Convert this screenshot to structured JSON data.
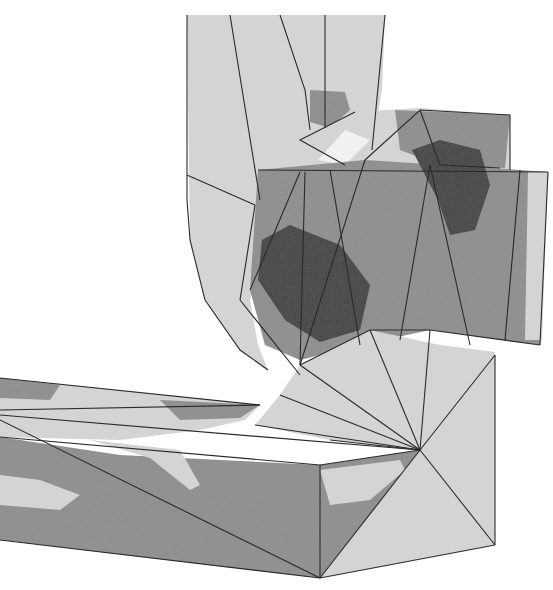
{
  "figure": {
    "width": 553,
    "height": 590,
    "background": "#ffffff",
    "colors": {
      "light": "#d6d6d6",
      "medium": "#8e8e8e",
      "dark": "#404040",
      "white_gap": "#f4f4f4",
      "edge": "#2a2a2a"
    }
  },
  "regions": [
    {
      "name": "vertical-pipe-body",
      "fill": "light",
      "points": "187,15 385,15 382,90 372,150 350,190 300,230 262,255 250,300 258,345 268,370 240,350 205,300 190,240"
    },
    {
      "name": "vertical-pipe-dark-patch",
      "fill": "medium",
      "points": "310,90 345,92 350,110 330,128 310,122"
    },
    {
      "name": "elbow-cap-light",
      "fill": "light",
      "points": "260,185 300,140 355,112 420,108 510,115 510,170 430,165 380,170 300,172 265,200"
    },
    {
      "name": "elbow-cap-medium",
      "fill": "medium",
      "points": "395,110 510,115 505,168 440,165 400,150"
    },
    {
      "name": "white-gap",
      "fill": "white_gap",
      "points": "318,160 345,130 370,140 345,165"
    },
    {
      "name": "front-cone-face",
      "fill": "medium",
      "points": "258,170 365,160 520,170 548,172 540,345 430,330 360,345 300,360 265,345 250,290"
    },
    {
      "name": "front-dark-blob",
      "fill": "dark",
      "points": "262,240 290,225 340,245 370,285 360,330 320,342 285,320 258,280"
    },
    {
      "name": "upper-dark-blob",
      "fill": "dark",
      "points": "412,150 440,140 480,150 490,185 475,230 450,235 438,200"
    },
    {
      "name": "right-light-strip",
      "fill": "light",
      "points": "528,172 548,172 542,340 525,340"
    },
    {
      "name": "neck-light",
      "fill": "light",
      "points": "300,365 370,330 440,345 495,352 490,390 420,450 330,440 255,425 280,395"
    },
    {
      "name": "right-box-face",
      "fill": "light",
      "points": "420,360 495,355 495,545 320,578 420,450"
    },
    {
      "name": "box-front-face",
      "fill": "medium",
      "points": "0,437 120,455 320,465 420,450 320,578 210,565 0,540"
    },
    {
      "name": "box-front-light-1",
      "fill": "light",
      "points": "0,475 40,480 80,495 60,510 0,505"
    },
    {
      "name": "box-front-light-2",
      "fill": "light",
      "points": "90,440 180,450 200,485 190,490 150,458"
    },
    {
      "name": "box-front-light-3",
      "fill": "light",
      "points": "320,470 400,460 405,470 370,500 330,505"
    },
    {
      "name": "box-top-face",
      "fill": "light",
      "points": "0,378 260,405 245,420 200,430 120,440 0,437"
    },
    {
      "name": "box-top-medium",
      "fill": "medium",
      "points": "0,378 60,385 50,400 0,398"
    },
    {
      "name": "box-top-medium-2",
      "fill": "medium",
      "points": "160,400 260,405 240,418 180,420"
    }
  ],
  "edges": [
    "187,15 187,200",
    "187,200 190,240 205,300 240,350 268,370",
    "230,15 260,200",
    "280,15 305,90 310,130",
    "325,15 325,128",
    "385,15 372,150",
    "187,175 255,205",
    "255,205 240,300",
    "240,300 300,375",
    "258,170 548,172",
    "300,172 250,290",
    "305,172 300,365",
    "330,170 360,345",
    "365,160 300,365",
    "430,165 400,340",
    "430,165 470,345",
    "520,170 505,340",
    "548,172 540,345",
    "365,160 420,110 510,115 510,170",
    "440,165 420,110",
    "440,165 500,168",
    "345,165 300,140 355,112",
    "300,365 370,330 430,330 540,345",
    "370,330 420,450",
    "430,330 420,450",
    "495,355 420,450",
    "495,355 495,545",
    "420,450 495,545",
    "320,578 495,545",
    "320,578 420,450",
    "320,465 420,450",
    "320,465 320,578",
    "0,378 260,405",
    "0,410 260,405",
    "0,415 420,450",
    "0,437 320,465",
    "0,540 320,578",
    "0,420 320,578",
    "255,425 420,450",
    "280,395 420,450",
    "330,440 420,450",
    "300,365 420,450"
  ]
}
